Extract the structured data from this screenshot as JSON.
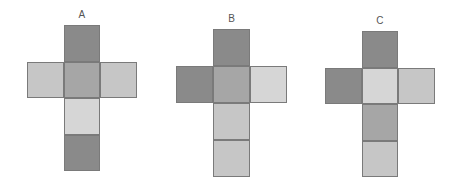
{
  "colors": {
    "dark": "#8a8a8a",
    "medium": "#a6a6a6",
    "light": "#c6c6c6",
    "pale": "#d6d6d6"
  },
  "nets": [
    {
      "label": "A",
      "faces": {
        "top": "dark",
        "left": "light",
        "center": "medium",
        "right": "light",
        "bottom1": "pale",
        "bottom2": "dark"
      }
    },
    {
      "label": "B",
      "faces": {
        "top": "dark",
        "left": "dark",
        "center": "medium",
        "right": "pale",
        "bottom1": "light",
        "bottom2": "light"
      }
    },
    {
      "label": "C",
      "faces": {
        "top": "dark",
        "left": "dark",
        "center": "pale",
        "right": "light",
        "bottom1": "medium",
        "bottom2": "light"
      }
    }
  ]
}
